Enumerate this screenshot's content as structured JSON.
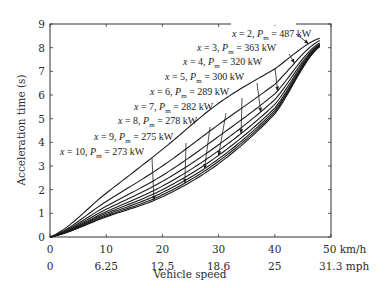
{
  "chart_data": {
    "type": "line",
    "title": "",
    "xlabel": "Vehicle speed",
    "ylabel": "Acceleration time (s)",
    "xlim": [
      0,
      50
    ],
    "ylim": [
      0,
      9
    ],
    "grid": false,
    "legend": "none",
    "x_ticks_kmh": [
      "0",
      "10",
      "20",
      "30",
      "40",
      "50 km/h"
    ],
    "x_ticks_kmh_values": [
      0,
      10,
      20,
      30,
      40,
      50
    ],
    "x_ticks_mph": [
      "0",
      "6.25",
      "12.5",
      "18.6",
      "25",
      "31.3  mph"
    ],
    "y_ticks": [
      "0",
      "1",
      "2",
      "3",
      "4",
      "5",
      "6",
      "7",
      "8",
      "9"
    ],
    "y_ticks_values": [
      0,
      1,
      2,
      3,
      4,
      5,
      6,
      7,
      8,
      9
    ],
    "x": [
      0,
      10,
      20,
      30,
      40,
      48
    ],
    "series": [
      {
        "name": "x = 2, Pm = 487 kW",
        "x_ratio": "2",
        "Pm": "487 kW",
        "values": [
          0,
          1.85,
          3.7,
          5.65,
          7.1,
          8.4
        ],
        "arrow_at": 46
      },
      {
        "name": "x = 3, Pm = 363 kW",
        "x_ratio": "3",
        "Pm": "363 kW",
        "values": [
          0,
          1.5,
          3.0,
          4.75,
          6.45,
          8.3
        ],
        "arrow_at": 43.5
      },
      {
        "name": "x = 4, Pm = 320 kW",
        "x_ratio": "4",
        "Pm": "320 kW",
        "values": [
          0,
          1.3,
          2.6,
          4.25,
          6.05,
          8.2
        ],
        "arrow_at": 40.5
      },
      {
        "name": "x = 5, Pm = 300 kW",
        "x_ratio": "5",
        "Pm": "300 kW",
        "values": [
          0,
          1.17,
          2.35,
          3.9,
          5.8,
          8.15
        ],
        "arrow_at": 37.5
      },
      {
        "name": "x = 6, Pm = 289 kW",
        "x_ratio": "6",
        "Pm": "289 kW",
        "values": [
          0,
          1.07,
          2.15,
          3.65,
          5.6,
          8.12
        ],
        "arrow_at": 34
      },
      {
        "name": "x = 7, Pm = 282 kW",
        "x_ratio": "7",
        "Pm": "282 kW",
        "values": [
          0,
          1.0,
          2.0,
          3.45,
          5.45,
          8.1
        ],
        "arrow_at": 30
      },
      {
        "name": "x = 8, Pm = 278 kW",
        "x_ratio": "8",
        "Pm": "278 kW",
        "values": [
          0,
          0.94,
          1.88,
          3.3,
          5.35,
          8.08
        ],
        "arrow_at": 27.5
      },
      {
        "name": "x = 9, Pm = 275 kW",
        "x_ratio": "9",
        "Pm": "275 kW",
        "values": [
          0,
          0.89,
          1.78,
          3.2,
          5.27,
          8.06
        ],
        "arrow_at": 24
      },
      {
        "name": "x = 10, Pm = 273 kW",
        "x_ratio": "10",
        "Pm": "273 kW",
        "values": [
          0,
          0.85,
          1.7,
          3.1,
          5.2,
          8.05
        ],
        "arrow_at": 18.5
      }
    ],
    "annotations": [
      {
        "prefix": "x",
        "eq": " = 2, ",
        "p": "P",
        "sub": "m",
        "tail": " = 487 kW"
      },
      {
        "prefix": "x",
        "eq": " = 3, ",
        "p": "P",
        "sub": "m",
        "tail": " = 363 kW"
      },
      {
        "prefix": "x",
        "eq": " = 4, ",
        "p": "P",
        "sub": "m",
        "tail": " = 320 kW"
      },
      {
        "prefix": "x",
        "eq": " = 5, ",
        "p": "P",
        "sub": "m",
        "tail": " = 300 kW"
      },
      {
        "prefix": "x",
        "eq": " = 6, ",
        "p": "P",
        "sub": "m",
        "tail": " = 289 kW"
      },
      {
        "prefix": "x",
        "eq": " = 7, ",
        "p": "P",
        "sub": "m",
        "tail": " = 282 kW"
      },
      {
        "prefix": "x",
        "eq": " = 8, ",
        "p": "P",
        "sub": "m",
        "tail": " = 278 kW"
      },
      {
        "prefix": "x",
        "eq": " = 9, ",
        "p": "P",
        "sub": "m",
        "tail": " = 275 kW"
      },
      {
        "prefix": "x",
        "eq": " = 10, ",
        "p": "P",
        "sub": "m",
        "tail": " = 273 kW"
      }
    ]
  }
}
